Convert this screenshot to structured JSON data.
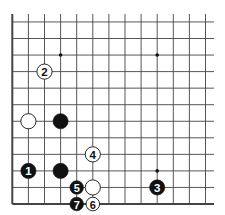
{
  "diagram": {
    "type": "go-board-corner",
    "edges": [
      "left",
      "bottom"
    ],
    "columns": 13,
    "rows": 12,
    "colors": {
      "background": "#ffffff",
      "line": "#444444",
      "black_stone": "#111111",
      "white_stone": "#ffffff",
      "black_label": "#ffffff",
      "white_label": "#111111"
    },
    "star_points": [
      {
        "col": 3,
        "row": 2
      },
      {
        "col": 9,
        "row": 2
      },
      {
        "col": 9,
        "row": 9
      }
    ],
    "stones": [
      {
        "color": "white",
        "col": 2,
        "row": 3,
        "label": "2"
      },
      {
        "color": "white",
        "col": 1,
        "row": 6,
        "label": ""
      },
      {
        "color": "black",
        "col": 3,
        "row": 6,
        "label": ""
      },
      {
        "color": "white",
        "col": 5,
        "row": 8,
        "label": "4"
      },
      {
        "color": "black",
        "col": 1,
        "row": 9,
        "label": "1"
      },
      {
        "color": "black",
        "col": 3,
        "row": 9,
        "label": ""
      },
      {
        "color": "black",
        "col": 4,
        "row": 10,
        "label": "5"
      },
      {
        "color": "white",
        "col": 5,
        "row": 10,
        "label": ""
      },
      {
        "color": "black",
        "col": 9,
        "row": 10,
        "label": "3"
      },
      {
        "color": "black",
        "col": 4,
        "row": 11,
        "label": "7"
      },
      {
        "color": "white",
        "col": 5,
        "row": 11,
        "label": "6"
      }
    ]
  }
}
